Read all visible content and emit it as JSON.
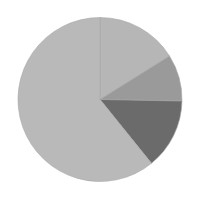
{
  "chart_data": {
    "type": "pie",
    "title": "",
    "labels": [
      "Slice A",
      "Slice B",
      "Slice C",
      "Slice D"
    ],
    "values": [
      16.1,
      9.2,
      13.9,
      60.8
    ],
    "colors": [
      "#b6b6b6",
      "#9a9a9a",
      "#6b6b6b",
      "#b9b9b9"
    ],
    "start_angle_deg_clockwise_from_top": 0,
    "direction": "clockwise",
    "legend": "none",
    "data_labels": "none",
    "center": [
      100,
      99.5
    ],
    "radius": 82,
    "stroke_color": "#a8a8a8"
  }
}
